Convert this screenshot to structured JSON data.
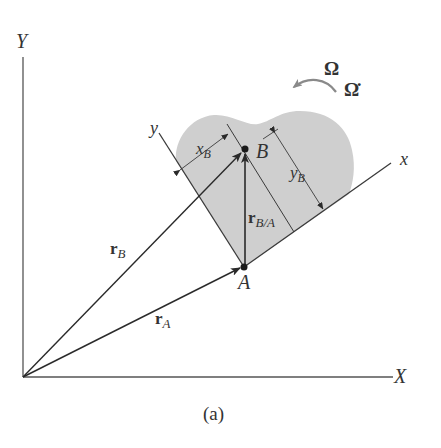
{
  "figure": {
    "caption": "(a)",
    "axes": {
      "X_label": "X",
      "Y_label": "Y",
      "x_label": "x",
      "y_label": "y"
    },
    "points": {
      "A": "A",
      "B": "B"
    },
    "vectors": {
      "rA": {
        "main": "r",
        "sub": "A"
      },
      "rB": {
        "main": "r",
        "sub": "B"
      },
      "rBA": {
        "main": "r",
        "sub": "B/A"
      }
    },
    "dimensions": {
      "xB": {
        "main": "x",
        "sub": "B"
      },
      "yB": {
        "main": "y",
        "sub": "B"
      }
    },
    "rotation": {
      "omega": "Ω",
      "omega_dot": "Ω̇"
    },
    "colors": {
      "body_fill": "#cfcfcf",
      "line": "#3a3a3a",
      "arrow_gray": "#8a8a8a"
    }
  }
}
